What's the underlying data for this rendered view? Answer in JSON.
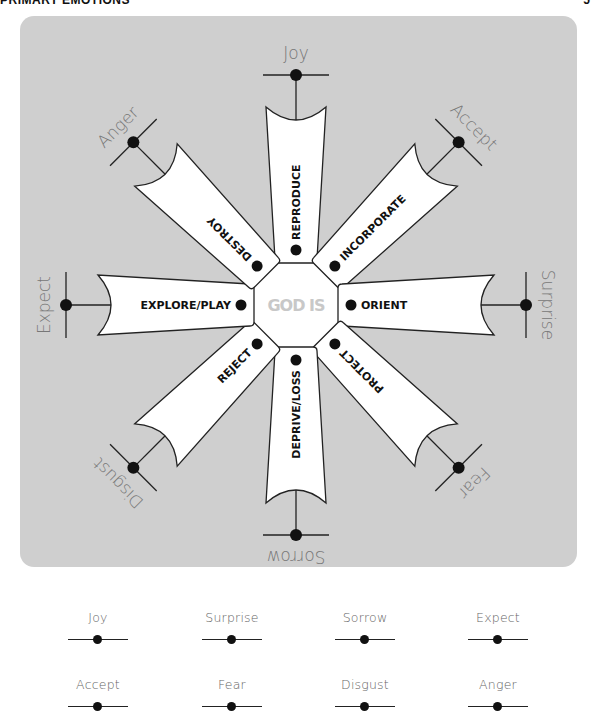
{
  "header": {
    "title": "PRIMARY EMOTIONS",
    "page_number": "5"
  },
  "diagram": {
    "center_label": "GOD IS",
    "colors": {
      "panel": "#cfcfcf",
      "arm_fill": "#ffffff",
      "stroke": "#222222",
      "center_text": "#c8c8c8",
      "emotion_text": "#777777"
    },
    "arms": [
      {
        "angle": 0,
        "function": "REPRODUCE",
        "emotion": "Joy"
      },
      {
        "angle": 45,
        "function": "INCORPORATE",
        "emotion": "Accept"
      },
      {
        "angle": 90,
        "function": "ORIENT",
        "emotion": "Surprise"
      },
      {
        "angle": 135,
        "function": "PROTECT",
        "emotion": "Fear"
      },
      {
        "angle": 180,
        "function": "DEPRIVE/LOSS",
        "emotion": "Sorrow"
      },
      {
        "angle": 225,
        "function": "REJECT",
        "emotion": "Disgust"
      },
      {
        "angle": 270,
        "function": "EXPLORE/PLAY",
        "emotion": "Expect"
      },
      {
        "angle": 315,
        "function": "DESTROY",
        "emotion": "Anger"
      }
    ]
  },
  "legend": {
    "items": [
      {
        "label": "Joy"
      },
      {
        "label": "Surprise"
      },
      {
        "label": "Sorrow"
      },
      {
        "label": "Expect"
      },
      {
        "label": "Accept"
      },
      {
        "label": "Fear"
      },
      {
        "label": "Disgust"
      },
      {
        "label": "Anger"
      }
    ]
  }
}
